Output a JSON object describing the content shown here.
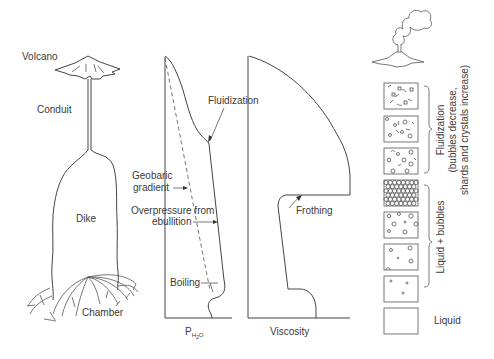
{
  "sketch": {
    "labels": {
      "volcano": "Volcano",
      "conduit": "Conduit",
      "dike": "Dike",
      "chamber": "Chamber"
    }
  },
  "pressure_panel": {
    "axis_label_main": "P",
    "axis_label_sub": "H",
    "axis_label_sub2": "2",
    "axis_label_sub3": "O",
    "annotations": {
      "fluidization": "Fluidization",
      "geobaric_1": "Geobaric",
      "geobaric_2": "gradient",
      "overpressure_1": "Overpressure from",
      "overpressure_2": "ebullition",
      "boiling": "Boiling"
    }
  },
  "viscosity_panel": {
    "axis_label": "Viscosity",
    "annotations": {
      "frothing": "Frothing"
    }
  },
  "stages": {
    "boxes": [
      {
        "state": "shards and crystals, few bubbles"
      },
      {
        "state": "shards, crystals, bubbles"
      },
      {
        "state": "bubbles, shards, crystals"
      },
      {
        "state": "packed bubbles (foam)"
      },
      {
        "state": "many bubbles"
      },
      {
        "state": "some bubbles"
      },
      {
        "state": "few small bubbles"
      },
      {
        "state": "liquid"
      }
    ],
    "labels": {
      "fluidization_1": "Fluidization",
      "fluidization_2": "(bubbles decrease,",
      "fluidization_3": "shards and crystals increase)",
      "liquid_bubbles": "Liquid + bubbles",
      "liquid": "Liquid"
    }
  }
}
